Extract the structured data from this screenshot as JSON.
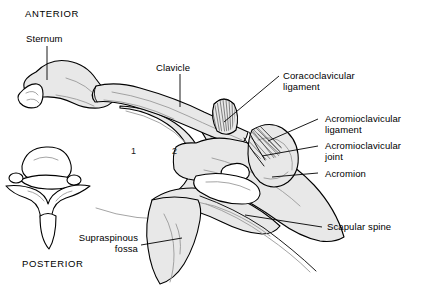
{
  "figure": {
    "type": "anatomical-line-diagram",
    "background_color": "#ffffff",
    "bone_fill_color": "#e8e8e8",
    "outline_color": "#000000",
    "leader_color": "#000000"
  },
  "orientation": {
    "anterior": "ANTERIOR",
    "posterior": "POSTERIOR"
  },
  "labels": {
    "sternum": "Sternum",
    "clavicle": "Clavicle",
    "coracoclavicular_ligament_line1": "Coracoclavicular",
    "coracoclavicular_ligament_line2": "ligament",
    "acromioclavicular_ligament_line1": "Acromioclavicular",
    "acromioclavicular_ligament_line2": "ligament",
    "acromioclavicular_joint_line1": "Acromioclavicular",
    "acromioclavicular_joint_line2": "joint",
    "acromion": "Acromion",
    "scapular_spine": "Scapular spine",
    "supraspinous_fossa_line1": "Supraspinous",
    "supraspinous_fossa_line2": "fossa"
  },
  "rib_numbers": {
    "first_rib": "1",
    "second_rib": "2"
  },
  "structures": [
    "sternum",
    "clavicle",
    "first-rib",
    "second-rib",
    "thoracic-vertebra",
    "coracoid-process",
    "coracoclavicular-ligament",
    "acromioclavicular-ligament",
    "acromioclavicular-joint",
    "acromion",
    "scapula",
    "scapular-spine",
    "supraspinous-fossa"
  ]
}
